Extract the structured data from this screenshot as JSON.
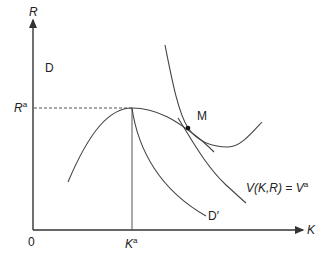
{
  "diagram": {
    "axes": {
      "y_label": "R",
      "x_label": "K",
      "origin_label": "0"
    },
    "reference_lines": {
      "r_label": "R",
      "r_sup": "a",
      "k_label": "K",
      "k_sup": "a"
    },
    "curves": {
      "d_label": "D",
      "d_prime_label": "D′",
      "v_label_prefix": "V(K,R) = V",
      "v_label_sup": "a",
      "point_label": "M"
    },
    "colors": {
      "line": "#444444",
      "axis": "#333333",
      "text": "#222222"
    }
  }
}
